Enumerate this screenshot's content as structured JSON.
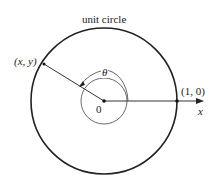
{
  "diagram": {
    "title": "unit circle",
    "point_label": "(x, y)",
    "angle_label": "θ",
    "origin_label": "0",
    "intercept_label": "(1, 0)",
    "axis_label": "x",
    "colors": {
      "stroke": "#222222",
      "background": "#ffffff"
    }
  }
}
